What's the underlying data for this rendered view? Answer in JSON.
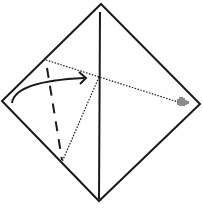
{
  "diagram": {
    "type": "origami-fold-diagram",
    "colors": {
      "background": "#ffffff",
      "line": "#1a1a1a"
    },
    "elements": {
      "paper": "diamond-square",
      "center_crease": "vertical-solid-line",
      "valley_fold_line": "dashed-line",
      "reference_lines": "dotted-lines",
      "fold_arrow": "curved-arrow",
      "target_marker": "striped-arrowhead"
    }
  }
}
